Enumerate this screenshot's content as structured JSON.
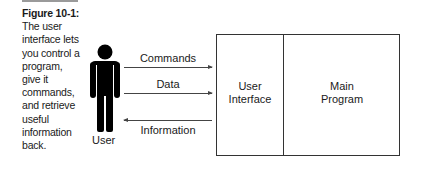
{
  "caption": {
    "figure_label": "Figure 10-1:",
    "text": "The user interface lets you control a program, give it commands, and retrieve useful information back."
  },
  "diagram": {
    "actor": {
      "label": "User",
      "icon": "person-icon"
    },
    "arrows": [
      {
        "label": "Commands",
        "direction": "right"
      },
      {
        "label": "Data",
        "direction": "right"
      },
      {
        "label": "Information",
        "direction": "left"
      }
    ],
    "box": {
      "left_section": {
        "line1": "User",
        "line2": "Interface"
      },
      "right_section": {
        "line1": "Main",
        "line2": "Program"
      }
    }
  },
  "colors": {
    "lines": "#333333",
    "figure": "#000000",
    "text": "#1a1a1a"
  }
}
